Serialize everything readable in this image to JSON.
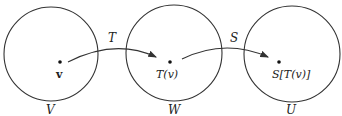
{
  "diagram": {
    "type": "function-composition",
    "sets": [
      {
        "id": "V",
        "label": "V",
        "point_label": "v"
      },
      {
        "id": "W",
        "label": "W",
        "point_label": "T(v)"
      },
      {
        "id": "U",
        "label": "U",
        "point_label": "S[T(v)]"
      }
    ],
    "maps": [
      {
        "label": "T",
        "from": "V",
        "to": "W"
      },
      {
        "label": "S",
        "from": "W",
        "to": "U"
      }
    ],
    "colors": {
      "stroke": "#333333",
      "text": "#222222"
    }
  }
}
